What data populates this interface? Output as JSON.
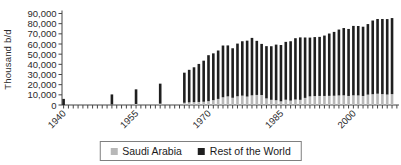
{
  "chart": {
    "ylabel": "Thousand b/d",
    "y_tick_labels": [
      "0",
      "10,000",
      "20,000",
      "30,000",
      "40,000",
      "50,000",
      "60,000",
      "70,000",
      "80,000",
      "90,000"
    ],
    "x_tick_labels": [
      "1940",
      "1955",
      "1970",
      "1985",
      "2000"
    ]
  },
  "legend": {
    "items": [
      {
        "label": "Saudi Arabia",
        "color": "#b8b8b8"
      },
      {
        "label": "Rest of the World",
        "color": "#1f1f1f"
      }
    ]
  },
  "chart_data": {
    "type": "bar",
    "stacked": true,
    "title": "",
    "xlabel": "",
    "ylabel": "Thousand b/d",
    "ylim": [
      0,
      90000
    ],
    "y_tick_step": 10000,
    "x_axis_range": [
      1940,
      2009
    ],
    "labeled_x_ticks": [
      1940,
      1955,
      1970,
      1985,
      2000
    ],
    "grid": false,
    "legend_position": "bottom",
    "categories": [
      1940,
      1950,
      1955,
      1960,
      1965,
      1966,
      1967,
      1968,
      1969,
      1970,
      1971,
      1972,
      1973,
      1974,
      1975,
      1976,
      1977,
      1978,
      1979,
      1980,
      1981,
      1982,
      1983,
      1984,
      1985,
      1986,
      1987,
      1988,
      1989,
      1990,
      1991,
      1992,
      1993,
      1994,
      1995,
      1996,
      1997,
      1998,
      1999,
      2000,
      2001,
      2002,
      2003,
      2004,
      2005,
      2006,
      2007,
      2008
    ],
    "series": [
      {
        "name": "Saudi Arabia",
        "color": "#b8b8b8",
        "values": [
          0,
          500,
          1000,
          1300,
          2200,
          2600,
          2800,
          3000,
          3200,
          3800,
          4800,
          6000,
          7600,
          8500,
          7100,
          8600,
          9200,
          8300,
          9500,
          9900,
          9800,
          6500,
          5100,
          4700,
          3600,
          5200,
          4300,
          5400,
          5100,
          7000,
          8500,
          8800,
          8900,
          8900,
          9000,
          9100,
          9400,
          9500,
          8900,
          9500,
          9400,
          8900,
          10200,
          10600,
          11100,
          10700,
          10300,
          10700
        ]
      },
      {
        "name": "Rest of the World",
        "color": "#1f1f1f",
        "values": [
          6000,
          9900,
          14400,
          19700,
          29600,
          32000,
          34300,
          37400,
          40400,
          45200,
          46000,
          47600,
          50900,
          50100,
          48700,
          51800,
          53500,
          55000,
          56500,
          53200,
          50300,
          51400,
          52700,
          54700,
          55400,
          56900,
          58400,
          60300,
          61400,
          59400,
          57800,
          58000,
          58100,
          59400,
          61300,
          62800,
          64800,
          66200,
          65900,
          68300,
          68300,
          68100,
          69400,
          72500,
          73500,
          73900,
          74200,
          74800
        ]
      }
    ]
  }
}
